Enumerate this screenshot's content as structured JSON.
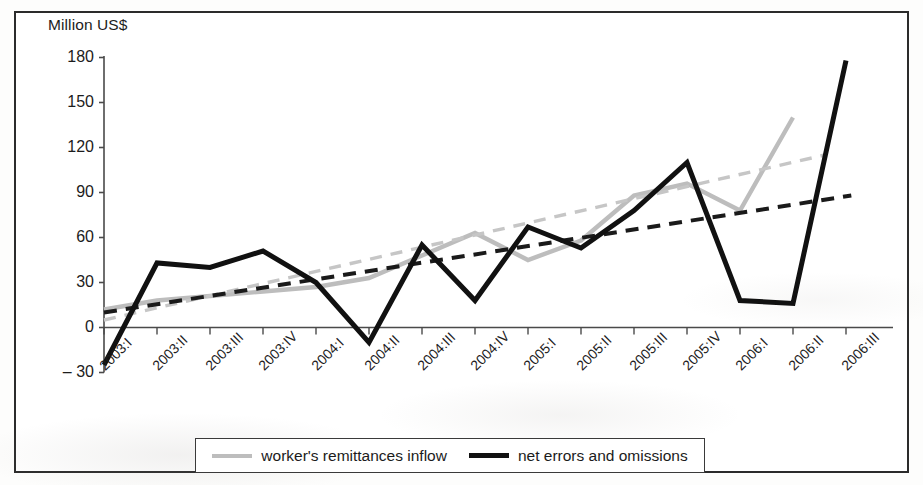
{
  "chart_data": {
    "type": "line",
    "title": "",
    "xlabel": "",
    "ylabel": "Million US$",
    "ylim": [
      -30,
      180
    ],
    "ytick_values": [
      180,
      150,
      120,
      90,
      60,
      30,
      0,
      -30
    ],
    "ytick_labels": [
      "180",
      "150",
      "120",
      "90",
      "60",
      "30",
      "0",
      "– 30"
    ],
    "grid": false,
    "legend_position": "bottom-center",
    "categories": [
      "2003:I",
      "2003:II",
      "2003:III",
      "2003:IV",
      "2004:I",
      "2004:II",
      "2004:III",
      "2004:IV",
      "2005:I",
      "2005:II",
      "2005:III",
      "2005:IV",
      "2006:I",
      "2006:II",
      "2006:III"
    ],
    "series": [
      {
        "name": "worker's remittances inflow",
        "color": "#bdbdbd",
        "style": "solid",
        "values": [
          12,
          18,
          21,
          24,
          27,
          33,
          48,
          63,
          45,
          58,
          88,
          96,
          78,
          140,
          null
        ]
      },
      {
        "name": "net errors and omissions",
        "color": "#111111",
        "style": "solid",
        "values": [
          -25,
          43,
          40,
          51,
          30,
          -10,
          55,
          18,
          67,
          53,
          78,
          110,
          18,
          16,
          178
        ]
      },
      {
        "name": "worker's remittances inflow trend",
        "color": "#c6c6c6",
        "style": "dashed",
        "trendline": true,
        "endpoints": [
          [
            0,
            5
          ],
          [
            13.6,
            115
          ]
        ]
      },
      {
        "name": "net errors and omissions trend",
        "color": "#1a1a1a",
        "style": "dashed",
        "trendline": true,
        "endpoints": [
          [
            0,
            10
          ],
          [
            14.1,
            88
          ]
        ]
      }
    ]
  },
  "legend": {
    "entries": [
      {
        "label": "worker's remittances inflow",
        "swatch": "series-gray"
      },
      {
        "label": "net errors and omissions",
        "swatch": "series-black"
      }
    ]
  }
}
